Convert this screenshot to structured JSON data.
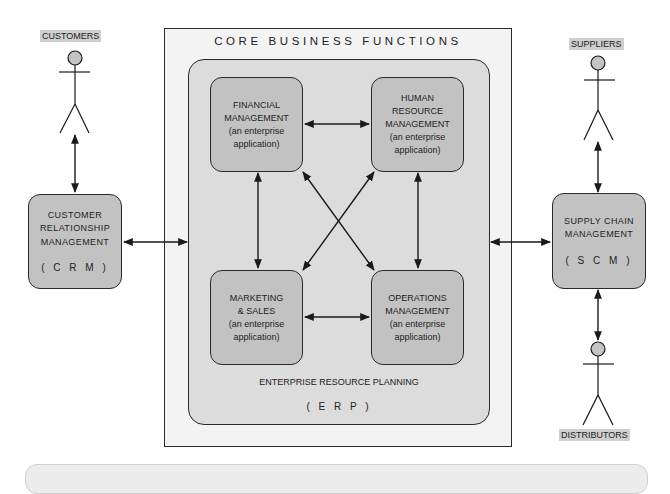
{
  "diagram": {
    "outer_container": {
      "title": "CORE BUSINESS FUNCTIONS"
    },
    "erp": {
      "label": "ENTERPRISE RESOURCE PLANNING",
      "abbr": "( E R P )",
      "modules": [
        {
          "id": "financial",
          "lines": [
            "FINANCIAL",
            "MANAGEMENT",
            "(an enterprise",
            "application)"
          ]
        },
        {
          "id": "hr",
          "lines": [
            "HUMAN",
            "RESOURCE",
            "MANAGEMENT",
            "(an enterprise",
            "application)"
          ]
        },
        {
          "id": "marketing",
          "lines": [
            "MARKETING",
            "& SALES",
            "(an enterprise",
            "application)"
          ]
        },
        {
          "id": "operations",
          "lines": [
            "OPERATIONS",
            "MANAGEMENT",
            "(an enterprise",
            "application)"
          ]
        }
      ]
    },
    "crm": {
      "lines": [
        "CUSTOMER",
        "RELATIONSHIP",
        "MANAGEMENT"
      ],
      "abbr": "( C R M )"
    },
    "scm": {
      "lines": [
        "SUPPLY CHAIN",
        "MANAGEMENT"
      ],
      "abbr": "( S C M )"
    },
    "actors": {
      "customers": "CUSTOMERS",
      "suppliers": "SUPPLIERS",
      "distributors": "DISTRIBUTORS"
    },
    "connections": [
      "customers <-> crm",
      "crm <-> erp",
      "erp <-> scm",
      "suppliers <-> scm",
      "scm <-> distributors",
      "financial <-> hr",
      "financial <-> marketing",
      "hr <-> operations",
      "marketing <-> operations",
      "financial <-> operations",
      "hr <-> marketing"
    ],
    "colors": {
      "outer_fill": "#f3f3f3",
      "erp_fill": "#dcdcdc",
      "module_fill": "#c2c2c2",
      "actor_label_fill": "#cfcfcf",
      "stroke": "#2a2a2a"
    }
  }
}
